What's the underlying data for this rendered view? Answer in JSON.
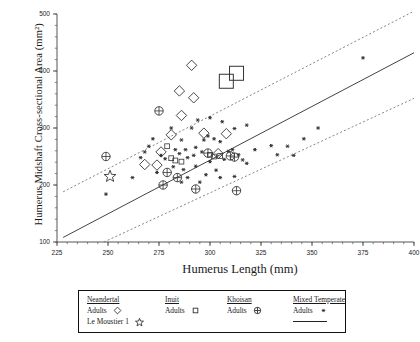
{
  "chart_data": {
    "type": "scatter",
    "title": "",
    "xlabel": "Humerus Length (mm)",
    "ylabel": "Humerus Midshaft Cross-sectional Area (mm²)",
    "xlim": [
      225,
      400
    ],
    "ylim": [
      100,
      500
    ],
    "xticks": [
      225,
      250,
      275,
      300,
      325,
      350,
      375,
      400
    ],
    "xtick_labels": [
      "225",
      "250",
      "275",
      "300",
      "325",
      "350",
      "375",
      "400"
    ],
    "yticks": [
      100,
      200,
      300,
      400,
      500
    ],
    "ytick_labels": [
      "100",
      "200",
      "300",
      "400",
      "500"
    ],
    "grid": false,
    "minor_ticks": true,
    "legend_position": "below-plot",
    "regression_line": {
      "name": "Mixed Temperate Adults regression",
      "style": "solid",
      "x": [
        228,
        400
      ],
      "y": [
        108,
        432
      ]
    },
    "prediction_bands": [
      {
        "name": "upper 95% prediction limit",
        "style": "dotted",
        "x": [
          228,
          400
        ],
        "y": [
          188,
          505
        ]
      },
      {
        "name": "lower 95% prediction limit",
        "style": "dotted",
        "x": [
          248,
          400
        ],
        "y": [
          100,
          352
        ]
      }
    ],
    "series": [
      {
        "name": "Neandertal Adults",
        "marker": "open-diamond",
        "points": [
          [
            291,
            410
          ],
          [
            285,
            365
          ],
          [
            292,
            353
          ],
          [
            286,
            322
          ],
          [
            281,
            288
          ],
          [
            297,
            291
          ],
          [
            308,
            290
          ],
          [
            276,
            258
          ],
          [
            274,
            235
          ],
          [
            304,
            255
          ],
          [
            268,
            236
          ]
        ]
      },
      {
        "name": "Le Moustier 1",
        "marker": "open-star",
        "points": [
          [
            251,
            215
          ]
        ]
      },
      {
        "name": "Neandertal specimens (large squares)",
        "marker": "large-open-square",
        "points": [
          [
            308,
            382
          ],
          [
            313,
            396
          ]
        ]
      },
      {
        "name": "Inuit Adults",
        "marker": "small-open-square",
        "points": [
          [
            279,
            268
          ],
          [
            281,
            247
          ],
          [
            283,
            243
          ],
          [
            286,
            241
          ],
          [
            300,
            253
          ],
          [
            302,
            250
          ],
          [
            305,
            251
          ]
        ]
      },
      {
        "name": "Khoisan Adults",
        "marker": "crossed-circle",
        "points": [
          [
            275,
            330
          ],
          [
            249,
            250
          ],
          [
            279,
            222
          ],
          [
            284,
            213
          ],
          [
            299,
            256
          ],
          [
            310,
            251
          ],
          [
            312,
            249
          ],
          [
            293,
            193
          ],
          [
            313,
            190
          ],
          [
            277,
            200
          ]
        ]
      },
      {
        "name": "Mixed Temperate Adults",
        "marker": "asterisk",
        "points": [
          [
            249,
            184
          ],
          [
            262,
            213
          ],
          [
            281,
            300
          ],
          [
            291,
            300
          ],
          [
            286,
            279
          ],
          [
            297,
            279
          ],
          [
            299,
            286
          ],
          [
            302,
            281
          ],
          [
            305,
            276
          ],
          [
            288,
            262
          ],
          [
            293,
            266
          ],
          [
            296,
            258
          ],
          [
            289,
            248
          ],
          [
            292,
            252
          ],
          [
            283,
            262
          ],
          [
            285,
            255
          ],
          [
            276,
            252
          ],
          [
            278,
            246
          ],
          [
            274,
            222
          ],
          [
            282,
            232
          ],
          [
            287,
            227
          ],
          [
            293,
            233
          ],
          [
            300,
            241
          ],
          [
            307,
            245
          ],
          [
            309,
            259
          ],
          [
            311,
            262
          ],
          [
            314,
            253
          ],
          [
            316,
            244
          ],
          [
            318,
            238
          ],
          [
            303,
            226
          ],
          [
            298,
            218
          ],
          [
            289,
            213
          ],
          [
            286,
            205
          ],
          [
            295,
            205
          ],
          [
            305,
            213
          ],
          [
            312,
            215
          ],
          [
            322,
            262
          ],
          [
            330,
            269
          ],
          [
            338,
            268
          ],
          [
            346,
            281
          ],
          [
            333,
            253
          ],
          [
            341,
            252
          ],
          [
            353,
            300
          ],
          [
            375,
            423
          ],
          [
            270,
            268
          ],
          [
            272,
            281
          ],
          [
            268,
            258
          ],
          [
            266,
            248
          ],
          [
            312,
            299
          ],
          [
            318,
            305
          ],
          [
            306,
            311
          ],
          [
            300,
            318
          ],
          [
            294,
            314
          ]
        ]
      }
    ]
  },
  "legend": {
    "columns": [
      {
        "header": "Neandertal",
        "rows": [
          {
            "label": "Adults",
            "marker": "open-diamond"
          },
          {
            "label": "Le Moustier 1",
            "marker": "open-star"
          }
        ]
      },
      {
        "header": "Inuit",
        "rows": [
          {
            "label": "Adults",
            "marker": "small-open-square"
          }
        ]
      },
      {
        "header": "Khoisan",
        "rows": [
          {
            "label": "Adults",
            "marker": "crossed-circle"
          }
        ]
      },
      {
        "header": "Mixed Temperate",
        "rows": [
          {
            "label": "Adults",
            "marker": "asterisk"
          },
          {
            "label": "",
            "marker": "line"
          }
        ]
      }
    ]
  },
  "colors": {
    "axis": "#555555",
    "marker": "#333333",
    "line": "#444444",
    "band": "#777777",
    "text": "#1a1a1a"
  }
}
